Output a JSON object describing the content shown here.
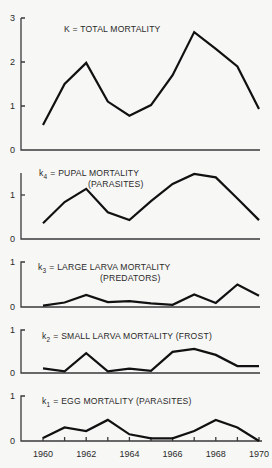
{
  "chart_data": [
    {
      "type": "line",
      "title": "K = TOTAL MORTALITY",
      "x": [
        1960,
        1961,
        1962,
        1963,
        1964,
        1965,
        1966,
        1967,
        1968,
        1969,
        1970
      ],
      "values": [
        0.57,
        1.5,
        1.98,
        1.1,
        0.78,
        1.02,
        1.7,
        2.68,
        2.3,
        1.9,
        0.93
      ],
      "yticks": [
        "0",
        "1",
        "2",
        "3"
      ],
      "ylim": [
        0,
        3
      ]
    },
    {
      "type": "line",
      "title": "k4 = PUPAL MORTALITY",
      "title_sub": "4",
      "subtitle": "(PARASITES)",
      "x": [
        1960,
        1961,
        1962,
        1963,
        1964,
        1965,
        1966,
        1967,
        1968,
        1969,
        1970
      ],
      "values": [
        0.36,
        0.84,
        1.14,
        0.61,
        0.43,
        0.86,
        1.25,
        1.48,
        1.4,
        0.92,
        0.43
      ],
      "yticks": [
        "0",
        "1"
      ],
      "ylim": [
        0,
        1.5
      ]
    },
    {
      "type": "line",
      "title": "k3 = LARGE LARVA MORTALITY",
      "title_sub": "3",
      "subtitle": "(PREDATORS)",
      "x": [
        1960,
        1961,
        1962,
        1963,
        1964,
        1965,
        1966,
        1967,
        1968,
        1969,
        1970
      ],
      "values": [
        0.03,
        0.1,
        0.27,
        0.11,
        0.13,
        0.08,
        0.05,
        0.28,
        0.09,
        0.5,
        0.25
      ],
      "yticks": [
        "0",
        "1"
      ],
      "ylim": [
        0,
        1
      ]
    },
    {
      "type": "line",
      "title": "k2 = SMALL LARVA MORTALITY (FROST)",
      "title_sub": "2",
      "x": [
        1960,
        1961,
        1962,
        1963,
        1964,
        1965,
        1966,
        1967,
        1968,
        1969,
        1970
      ],
      "values": [
        0.11,
        0.04,
        0.46,
        0.04,
        0.1,
        0.05,
        0.49,
        0.56,
        0.42,
        0.16,
        0.16
      ],
      "yticks": [
        "0",
        "1"
      ],
      "ylim": [
        0,
        1
      ]
    },
    {
      "type": "line",
      "title": "k1 = EGG MORTALITY (PARASITES)",
      "title_sub": "1",
      "x": [
        1960,
        1961,
        1962,
        1963,
        1964,
        1965,
        1966,
        1967,
        1968,
        1969,
        1970
      ],
      "values": [
        0.07,
        0.3,
        0.22,
        0.47,
        0.15,
        0.06,
        0.06,
        0.22,
        0.47,
        0.3,
        0.0
      ],
      "yticks": [
        "0",
        "1"
      ],
      "ylim": [
        0,
        1
      ],
      "xticks": [
        "1960",
        "1962",
        "1964",
        "1966",
        "1968",
        "1970"
      ]
    }
  ],
  "labels": {
    "p1": {
      "title": "K = TOTAL MORTALITY",
      "ticks": [
        "0",
        "1",
        "2",
        "3"
      ]
    },
    "p2": {
      "k": "k",
      "sub": "4",
      "rest": "=  PUPAL MORTALITY",
      "line2": "(PARASITES)",
      "ticks": [
        "0",
        "1"
      ]
    },
    "p3": {
      "k": "k",
      "sub": "3",
      "rest": "=  LARGE LARVA MORTALITY",
      "line2": "(PREDATORS)",
      "ticks": [
        "0",
        "1"
      ]
    },
    "p4": {
      "k": "k",
      "sub": "2",
      "rest": "=  SMALL LARVA MORTALITY (FROST)",
      "ticks": [
        "0",
        "1"
      ]
    },
    "p5": {
      "k": "k",
      "sub": "1",
      "rest": "=  EGG MORTALITY (PARASITES)",
      "ticks": [
        "0",
        "1"
      ]
    },
    "xticks": [
      "1960",
      "1962",
      "1964",
      "1966",
      "1968",
      "1970"
    ]
  }
}
